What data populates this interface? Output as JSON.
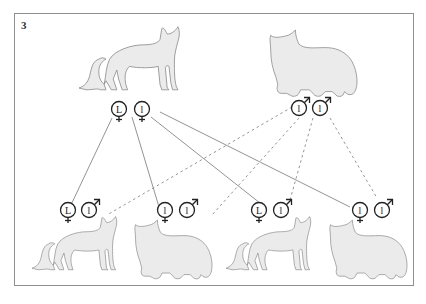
{
  "figure": {
    "panel_label": "3",
    "border_color": "#8f8f8f",
    "cat_fill": "#ebebeb",
    "cat_stroke": "#8a8a8a"
  },
  "parents": [
    {
      "id": "mother",
      "sex": "female",
      "coat": "short-hair",
      "gametes": [
        {
          "allele": "L",
          "symbol": "female-symbol"
        },
        {
          "allele": "l",
          "symbol": "female-symbol"
        }
      ]
    },
    {
      "id": "father",
      "sex": "male",
      "coat": "long-hair",
      "gametes": [
        {
          "allele": "l",
          "symbol": "male-symbol"
        },
        {
          "allele": "l",
          "symbol": "male-symbol"
        }
      ]
    }
  ],
  "offspring": [
    {
      "id": "kitten-1",
      "coat": "short-hair",
      "genotype": [
        "L",
        "l"
      ]
    },
    {
      "id": "kitten-2",
      "coat": "long-hair",
      "genotype": [
        "l",
        "l"
      ]
    },
    {
      "id": "kitten-3",
      "coat": "short-hair",
      "genotype": [
        "L",
        "l"
      ]
    },
    {
      "id": "kitten-4",
      "coat": "long-hair",
      "genotype": [
        "l",
        "l"
      ]
    }
  ],
  "legend": {
    "solid_line": "maternal allele path",
    "dashed_line": "paternal allele path"
  }
}
